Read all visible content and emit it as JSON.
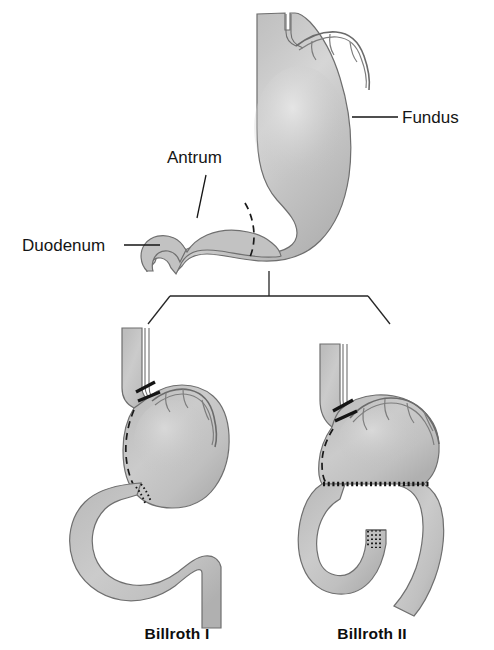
{
  "figure": {
    "background_color": "#ffffff",
    "organ_fill_color": "#c2c2c2",
    "organ_outline_color": "#6e6e6e",
    "label_text_color": "#151515",
    "suture_color": "#141414"
  },
  "anatomy_labels": [
    {
      "id": "fundus",
      "text": "Fundus",
      "x": 402,
      "y": 122,
      "anchor": "start"
    },
    {
      "id": "antrum",
      "text": "Antrum",
      "x": 167,
      "y": 164,
      "anchor": "start"
    },
    {
      "id": "duodenum",
      "text": "Duodenum",
      "x": 23,
      "y": 250,
      "anchor": "start"
    }
  ],
  "procedure_captions": [
    {
      "id": "billroth-1",
      "text": "Billroth I",
      "x": 177,
      "y": 638,
      "anchor": "middle"
    },
    {
      "id": "billroth-2",
      "text": "Billroth II",
      "x": 372,
      "y": 638,
      "anchor": "middle"
    }
  ],
  "panels": {
    "top": {
      "name": "normal-stomach-with-resection-line",
      "parts": [
        "esophagus",
        "fundus",
        "body",
        "antrum",
        "pylorus",
        "duodenum",
        "vagus-nerve-arcade",
        "resection-dashed-line"
      ]
    },
    "bottom_left": {
      "name": "billroth-1-gastroduodenostomy",
      "parts": [
        "esophagus",
        "gastric-remnant",
        "duodenum-loop",
        "anastomosis-suture-line",
        "cut-vagus-nerves",
        "resection-dashed-line"
      ]
    },
    "bottom_right": {
      "name": "billroth-2-gastrojejunostomy",
      "parts": [
        "esophagus",
        "gastric-remnant",
        "afferent-limb",
        "efferent-limb",
        "duodenal-stump-closure",
        "gastrojejunostomy-suture-line",
        "cut-vagus-nerves",
        "resection-dashed-line"
      ]
    }
  },
  "connector": {
    "name": "branching-bracket",
    "stem_x": 269,
    "stem_top_y": 271,
    "stem_bottom_y": 295,
    "left_end_x": 170,
    "right_end_x": 375,
    "bar_y": 295
  }
}
